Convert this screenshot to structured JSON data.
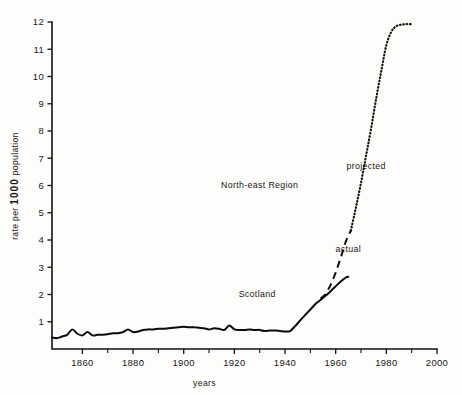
{
  "chart_data": {
    "type": "line",
    "title": "",
    "xlabel": "years",
    "ylabel": "rate per 1000 population",
    "ylabel_parts": {
      "prefix": "rate per",
      "emphasis": "1000",
      "suffix": "population"
    },
    "xlim": [
      1848,
      2000
    ],
    "ylim": [
      0,
      12
    ],
    "xticks": [
      1860,
      1880,
      1900,
      1920,
      1940,
      1960,
      1980,
      2000
    ],
    "xticklabels": [
      "1860",
      "1880",
      "1900",
      "1920",
      "1940",
      "1960",
      "1980",
      "2000"
    ],
    "xminorticks": [
      1870,
      1890,
      1910,
      1930,
      1950,
      1970,
      1990
    ],
    "yticks": [
      1,
      2,
      3,
      4,
      5,
      6,
      7,
      8,
      9,
      10,
      11,
      12
    ],
    "yticklabels": [
      "1",
      "2",
      "3",
      "4",
      "5",
      "6",
      "7",
      "8",
      "9",
      "10",
      "11",
      "12"
    ],
    "grid": false,
    "legend_position": "inline-annotations",
    "annotations": [
      {
        "text": "North-east Region",
        "x": 1930,
        "y": 5.9
      },
      {
        "text": "projected",
        "x": 1972,
        "y": 6.6
      },
      {
        "text": "actual",
        "x": 1965,
        "y": 3.55
      },
      {
        "text": "Scotland",
        "x": 1929,
        "y": 1.9
      }
    ],
    "series": [
      {
        "name": "Scotland",
        "style": "solid",
        "x": [
          1848,
          1850,
          1852,
          1854,
          1856,
          1858,
          1860,
          1862,
          1864,
          1866,
          1868,
          1870,
          1872,
          1874,
          1876,
          1878,
          1880,
          1882,
          1884,
          1886,
          1888,
          1890,
          1892,
          1894,
          1896,
          1898,
          1900,
          1902,
          1904,
          1906,
          1908,
          1910,
          1912,
          1914,
          1916,
          1918,
          1920,
          1922,
          1924,
          1926,
          1928,
          1930,
          1932,
          1934,
          1936,
          1938,
          1940,
          1942,
          1944,
          1946,
          1948,
          1950,
          1952,
          1954,
          1956,
          1958,
          1960,
          1962,
          1964,
          1965
        ],
        "values": [
          0.42,
          0.4,
          0.46,
          0.52,
          0.72,
          0.56,
          0.5,
          0.62,
          0.5,
          0.52,
          0.52,
          0.54,
          0.58,
          0.58,
          0.62,
          0.72,
          0.62,
          0.64,
          0.7,
          0.72,
          0.72,
          0.74,
          0.74,
          0.76,
          0.78,
          0.8,
          0.82,
          0.8,
          0.8,
          0.78,
          0.76,
          0.72,
          0.76,
          0.74,
          0.7,
          0.86,
          0.72,
          0.7,
          0.7,
          0.72,
          0.7,
          0.7,
          0.66,
          0.68,
          0.68,
          0.66,
          0.64,
          0.66,
          0.84,
          1.05,
          1.25,
          1.45,
          1.65,
          1.8,
          1.95,
          2.12,
          2.3,
          2.48,
          2.62,
          2.65
        ]
      },
      {
        "name": "North-east Region actual",
        "style": "dashed",
        "x": [
          1954,
          1956,
          1958,
          1960,
          1962,
          1964,
          1966
        ],
        "values": [
          1.85,
          2.0,
          2.35,
          2.8,
          3.35,
          3.95,
          4.35
        ]
      },
      {
        "name": "North-east Region projected",
        "style": "dotted",
        "x": [
          1966,
          1968,
          1970,
          1972,
          1974,
          1976,
          1978,
          1980,
          1982,
          1984,
          1986,
          1988,
          1990
        ],
        "values": [
          4.35,
          5.2,
          6.1,
          7.1,
          8.1,
          9.2,
          10.2,
          11.15,
          11.65,
          11.85,
          11.9,
          11.92,
          11.92
        ]
      }
    ]
  }
}
